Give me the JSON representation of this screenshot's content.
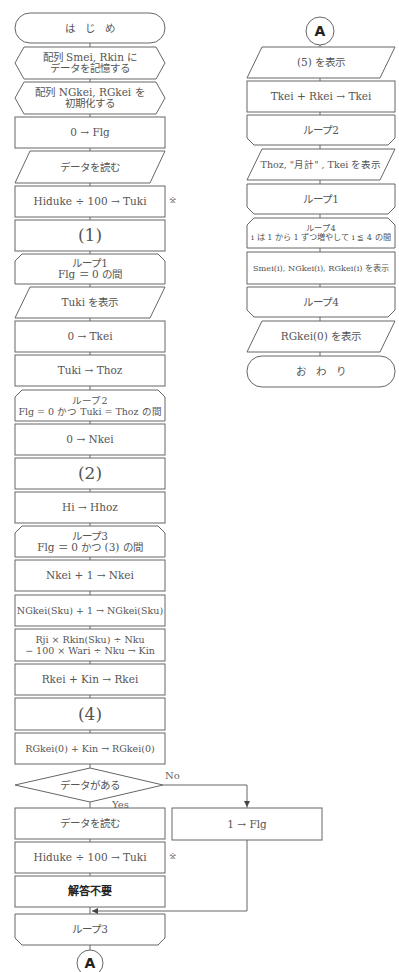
{
  "left_column": [
    {
      "id": "start",
      "shape": "terminal",
      "text": "は　じ　め"
    },
    {
      "id": "prep1",
      "shape": "preparation",
      "text": "配列 Smei, Rkin に\nデータを記憶する"
    },
    {
      "id": "prep2",
      "shape": "preparation",
      "text": "配列 NGkei, RGkei を\n初期化する"
    },
    {
      "id": "p1",
      "shape": "process",
      "text": "0 → Flg"
    },
    {
      "id": "io1",
      "shape": "io",
      "text": "データを読む"
    },
    {
      "id": "p2",
      "shape": "process",
      "text": "Hiduke ÷ 100 → Tuki"
    },
    {
      "id": "blank1",
      "shape": "process",
      "text": "(1)"
    },
    {
      "id": "loop1",
      "shape": "loop-start",
      "text": "ループ1\nFlg ＝ 0 の間"
    },
    {
      "id": "io2",
      "shape": "io",
      "text": "Tuki を表示"
    },
    {
      "id": "p3",
      "shape": "process",
      "text": "0 → Tkei"
    },
    {
      "id": "p4",
      "shape": "process",
      "text": "Tuki → Thoz"
    },
    {
      "id": "loop2",
      "shape": "loop-start",
      "text": "ループ2\nFlg = 0 かつ Tuki = Thoz の間"
    },
    {
      "id": "p5",
      "shape": "process",
      "text": "0 → Nkei"
    },
    {
      "id": "blank2",
      "shape": "process",
      "text": "(2)"
    },
    {
      "id": "p6",
      "shape": "process",
      "text": "Hi → Hhoz"
    },
    {
      "id": "loop3",
      "shape": "loop-start",
      "text": "ループ3\nFlg ＝ 0 かつ (3) の間"
    },
    {
      "id": "p7",
      "shape": "process",
      "text": "Nkei + 1 → Nkei"
    },
    {
      "id": "p8",
      "shape": "process",
      "text": "NGkei(Sku) + 1 → NGkei(Sku)"
    },
    {
      "id": "p9",
      "shape": "process",
      "text": "Rji × Rkin(Sku) ÷ Nku\n− 100 × Wari ÷ Nku → Kin"
    },
    {
      "id": "p10",
      "shape": "process",
      "text": "Rkei + Kin → Rkei"
    },
    {
      "id": "blank4",
      "shape": "process",
      "text": "(4)"
    },
    {
      "id": "p11",
      "shape": "process",
      "text": "RGkei(0) + Kin → RGkei(0)"
    },
    {
      "id": "dec1",
      "shape": "decision",
      "text": "データがある"
    },
    {
      "id": "io3",
      "shape": "io-rect",
      "text": "データを読む"
    },
    {
      "id": "p12",
      "shape": "process",
      "text": "Hiduke ÷ 100 → Tuki"
    },
    {
      "id": "p13",
      "shape": "process",
      "text": "解答不要"
    },
    {
      "id": "loop3end",
      "shape": "loop-end",
      "text": "ループ3"
    },
    {
      "id": "connA1",
      "shape": "connector",
      "text": "A"
    }
  ],
  "right_branch": {
    "text": "1 → Flg"
  },
  "decision_labels": {
    "no": "No",
    "yes": "Yes"
  },
  "notes": {
    "mark1": "※",
    "mark2": "※"
  },
  "right_column": [
    {
      "id": "connA2",
      "shape": "connector",
      "text": "A"
    },
    {
      "id": "io5",
      "shape": "io",
      "text": "(5) を表示"
    },
    {
      "id": "r1",
      "shape": "process",
      "text": "Tkei + Rkei → Tkei"
    },
    {
      "id": "loop2end",
      "shape": "loop-end",
      "text": "ループ2"
    },
    {
      "id": "io6",
      "shape": "io",
      "text": "Thoz, \"月計\" , Tkei を表示"
    },
    {
      "id": "loop1end",
      "shape": "loop-end",
      "text": "ループ1"
    },
    {
      "id": "loop4",
      "shape": "loop-start",
      "text": "ループ4\ni は 1 から 1 ずつ増やして i ≦ 4 の間"
    },
    {
      "id": "r2",
      "shape": "process",
      "text": "Smei(i), NGkei(i), RGkei(i) を表示"
    },
    {
      "id": "loop4end",
      "shape": "loop-end",
      "text": "ループ4"
    },
    {
      "id": "io7",
      "shape": "io",
      "text": "RGkei(0) を表示"
    },
    {
      "id": "end",
      "shape": "terminal",
      "text": "お　わ　り"
    }
  ]
}
